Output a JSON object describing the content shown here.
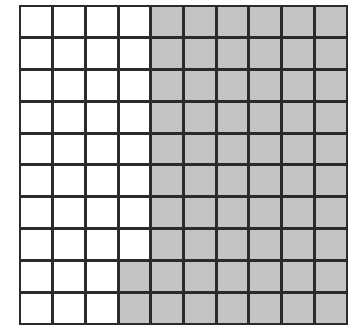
{
  "figure": {
    "kind": "shaded-square-grid",
    "rows": 10,
    "columns": 10,
    "total_cells": 100,
    "shaded_cells": 62,
    "unshaded_cells": 38,
    "shaded_fraction": "62/100",
    "shaded_percent": "62%"
  },
  "colors": {
    "shaded_fill": "#c4c4c4",
    "unshaded_fill": "#ffffff",
    "grid_line": "#2b2b2b",
    "background": "#ffffff"
  },
  "chart_data": {
    "type": "heatmap",
    "title": "",
    "subtitle": "",
    "xlabel": "",
    "ylabel": "",
    "legend": [],
    "annotations": [],
    "grid": true,
    "categories_x": [
      "1",
      "2",
      "3",
      "4",
      "5",
      "6",
      "7",
      "8",
      "9",
      "10"
    ],
    "categories_y": [
      "1",
      "2",
      "3",
      "4",
      "5",
      "6",
      "7",
      "8",
      "9",
      "10"
    ],
    "value_labels": {
      "0": "unshaded",
      "1": "shaded"
    },
    "values": [
      [
        0,
        0,
        0,
        0,
        1,
        1,
        1,
        1,
        1,
        1
      ],
      [
        0,
        0,
        0,
        0,
        1,
        1,
        1,
        1,
        1,
        1
      ],
      [
        0,
        0,
        0,
        0,
        1,
        1,
        1,
        1,
        1,
        1
      ],
      [
        0,
        0,
        0,
        0,
        1,
        1,
        1,
        1,
        1,
        1
      ],
      [
        0,
        0,
        0,
        0,
        1,
        1,
        1,
        1,
        1,
        1
      ],
      [
        0,
        0,
        0,
        0,
        1,
        1,
        1,
        1,
        1,
        1
      ],
      [
        0,
        0,
        0,
        0,
        1,
        1,
        1,
        1,
        1,
        1
      ],
      [
        0,
        0,
        0,
        0,
        1,
        1,
        1,
        1,
        1,
        1
      ],
      [
        0,
        0,
        0,
        1,
        1,
        1,
        1,
        1,
        1,
        1
      ],
      [
        0,
        0,
        0,
        1,
        1,
        1,
        1,
        1,
        1,
        1
      ]
    ],
    "row_shaded_counts": [
      6,
      6,
      6,
      6,
      6,
      6,
      6,
      6,
      7,
      7
    ],
    "total_shaded": 62
  }
}
